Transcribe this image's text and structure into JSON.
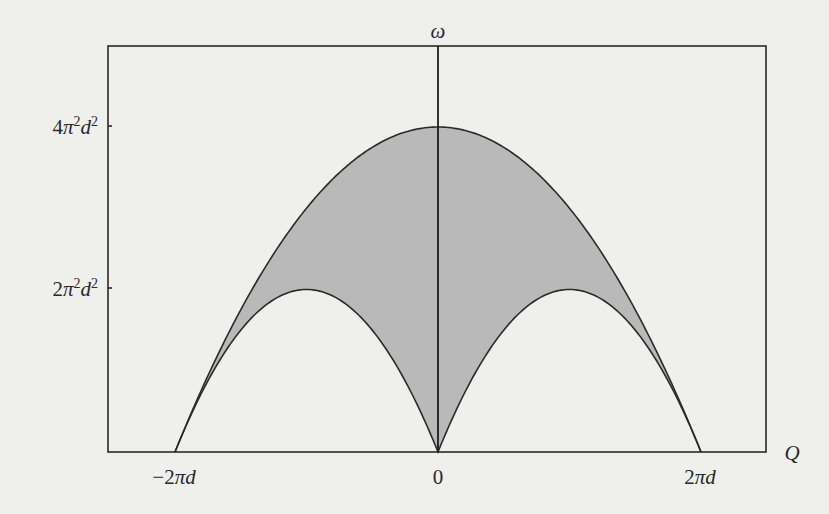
{
  "chart_data": {
    "type": "area",
    "title": "",
    "xlabel": "Q",
    "ylabel": "ω",
    "x_ticks": [
      {
        "value": "-2πd",
        "label_parts": [
          "−2",
          "π",
          "d"
        ]
      },
      {
        "value": "0",
        "label_parts": [
          "0"
        ]
      },
      {
        "value": "2πd",
        "label_parts": [
          "2",
          "π",
          "d"
        ]
      }
    ],
    "y_ticks": [
      {
        "value": "2π²d²",
        "label_parts": [
          "2",
          "π",
          "2",
          "d",
          "2"
        ]
      },
      {
        "value": "4π²d²",
        "label_parts": [
          "4",
          "π",
          "2",
          "d",
          "2"
        ]
      }
    ],
    "x_range_units_of_pid": [
      -2.6,
      2.5
    ],
    "y_range_units_of_pi2d2": [
      0,
      5.0
    ],
    "series": [
      {
        "name": "upper boundary",
        "formula": "ω = 4π²d² − Q²",
        "x_pid": [
          -2,
          -1.5,
          -1,
          -0.5,
          0,
          0.5,
          1,
          1.5,
          2
        ],
        "y_pi2d2": [
          0,
          1.75,
          3,
          3.75,
          4,
          3.75,
          3,
          1.75,
          0
        ]
      },
      {
        "name": "lower boundary",
        "formula": "ω = 4πd|Q| − 2Q²",
        "x_pid": [
          -2,
          -1.5,
          -1,
          -0.5,
          0,
          0.5,
          1,
          1.5,
          2
        ],
        "y_pi2d2": [
          0,
          1.5,
          2,
          1.5,
          0,
          1.5,
          2,
          1.5,
          0
        ]
      }
    ],
    "shaded_region": "between upper and lower boundaries",
    "fill_color": "#b9b9b9",
    "line_color": "#2a2a2a",
    "grid": false,
    "legend": "none"
  },
  "labels": {
    "y_axis": "ω",
    "x_axis": "Q",
    "tick_4pi2d2": {
      "coef": "4",
      "pi": "π",
      "exp1": "2",
      "d": "d",
      "exp2": "2"
    },
    "tick_2pi2d2": {
      "coef": "2",
      "pi": "π",
      "exp1": "2",
      "d": "d",
      "exp2": "2"
    },
    "tick_neg2pid": {
      "coef": "−2",
      "pi": "π",
      "d": "d"
    },
    "tick_zero": "0",
    "tick_2pid": {
      "coef": "2",
      "pi": "π",
      "d": "d"
    }
  }
}
